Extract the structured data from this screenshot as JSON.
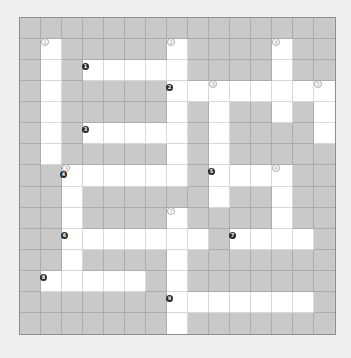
{
  "puzzle": {
    "title": "",
    "rows": 15,
    "cols": 15,
    "colors": {
      "background": "#efefef",
      "blocked_cell": "#c9c9c9",
      "open_cell": "#ffffff",
      "grid_line": "#acacac",
      "down_label": "#9a9a9a",
      "across_label": "#2a2a2a"
    },
    "layout": [
      "###############",
      "#.#####.####.##",
      "#.#.....####.##",
      "#.#####........",
      "#.#####.#.##.#.",
      "#.#.....#.####.",
      "#.#####.#.#####",
      "##......#....##",
      "##.######.##.##",
      "##.####.####.##",
      "##.......#....#",
      "##.####.#######",
      "#.....#.#######",
      "#######.......#",
      "#######.#######"
    ],
    "down_labels": [
      {
        "row": 1,
        "col": 1,
        "text": "①"
      },
      {
        "row": 1,
        "col": 7,
        "text": "②"
      },
      {
        "row": 1,
        "col": 12,
        "text": "④"
      },
      {
        "row": 3,
        "col": 9,
        "text": "③"
      },
      {
        "row": 3,
        "col": 14,
        "text": "⑤"
      },
      {
        "row": 7,
        "col": 2,
        "text": "③"
      },
      {
        "row": 7,
        "col": 12,
        "text": "⑥"
      },
      {
        "row": 9,
        "col": 7,
        "text": "⑦"
      }
    ],
    "across_labels": [
      {
        "row": 2,
        "col": 3,
        "text": "1"
      },
      {
        "row": 3,
        "col": 7,
        "text": "2"
      },
      {
        "row": 5,
        "col": 3,
        "text": "3"
      },
      {
        "row": 7,
        "col": 2,
        "text": "4"
      },
      {
        "row": 7,
        "col": 9,
        "text": "5"
      },
      {
        "row": 10,
        "col": 2,
        "text": "6"
      },
      {
        "row": 10,
        "col": 10,
        "text": "7"
      },
      {
        "row": 12,
        "col": 1,
        "text": "8"
      },
      {
        "row": 13,
        "col": 7,
        "text": "9"
      }
    ]
  }
}
